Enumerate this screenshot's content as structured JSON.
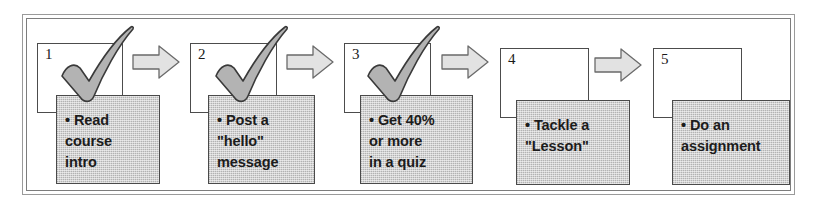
{
  "diagram": {
    "frame_label": "diagram-frame",
    "colors": {
      "task_fill": "#d2d2d2",
      "task_border": "#4a4a4a",
      "card_border": "#4c4c4c",
      "arrow_fill": "#e2e2e2",
      "arrow_border": "#6a6a6a",
      "check_fill": "#b3b3b3",
      "check_border": "#3a3a3a",
      "text": "#1c1c1c",
      "background": "#ffffff"
    },
    "steps": [
      {
        "number": "1",
        "text": "• Read\ncourse\nintro",
        "completed": true,
        "check_icon": "check-icon"
      },
      {
        "number": "2",
        "text": "• Post a\n\"hello\"\nmessage",
        "completed": true,
        "check_icon": "check-icon"
      },
      {
        "number": "3",
        "text": "• Get 40%\nor more\nin a quiz",
        "completed": true,
        "check_icon": "check-icon"
      },
      {
        "number": "4",
        "text": "• Tackle a\n\"Lesson\"",
        "completed": false,
        "check_icon": null
      },
      {
        "number": "5",
        "text": "• Do an\nassignment",
        "completed": false,
        "check_icon": null
      }
    ],
    "arrows": [
      {
        "name": "arrow-1-to-2"
      },
      {
        "name": "arrow-2-to-3"
      },
      {
        "name": "arrow-3-to-4"
      },
      {
        "name": "arrow-4-to-5"
      }
    ]
  }
}
